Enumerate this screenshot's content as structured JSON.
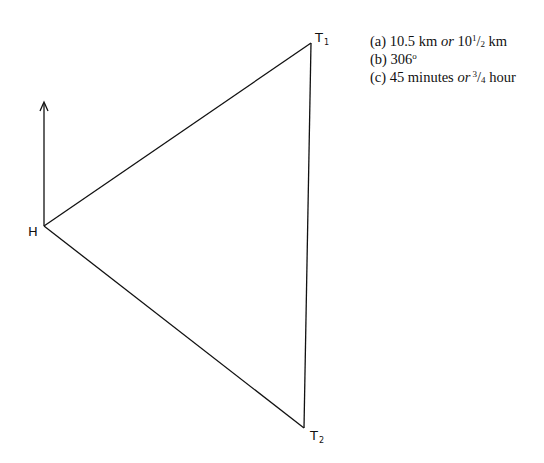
{
  "diagram": {
    "points": {
      "H": {
        "label": "H",
        "x": 44,
        "y": 226
      },
      "T1": {
        "label": "T",
        "subscript": "1",
        "x": 311,
        "y": 43
      },
      "T2": {
        "label": "T",
        "subscript": "2",
        "x": 304,
        "y": 428
      }
    },
    "north_arrow": {
      "x": 44,
      "y_top": 102,
      "y_bottom": 226
    },
    "line_color": "#111111"
  },
  "answers": {
    "a": {
      "prefix": "(a) 10.5 km ",
      "or": "or",
      "whole": " 10",
      "num": "1",
      "slash": "/",
      "den": "2",
      "suffix": " km"
    },
    "b": {
      "text": "(b) 306",
      "deg": "o"
    },
    "c": {
      "prefix": "(c) 45 minutes ",
      "or": "or",
      "num": " 3",
      "slash": "/",
      "den": "4",
      "suffix": " hour"
    }
  }
}
